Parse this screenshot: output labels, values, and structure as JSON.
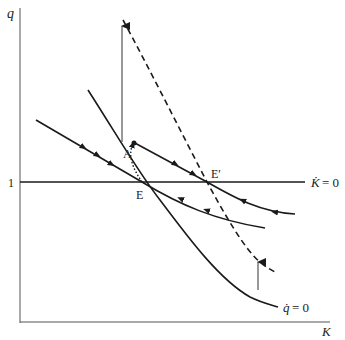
{
  "diagram": {
    "type": "phase-diagram",
    "axes": {
      "x_label": "K",
      "y_label": "q",
      "y_tick_label": "1"
    },
    "loci": {
      "k_dot_zero": {
        "label_lhs": "K̇",
        "label_rhs": "= 0"
      },
      "q_dot_zero": {
        "label_lhs": "q̇",
        "label_rhs": "= 0"
      },
      "q_dot_zero_shifted": {
        "style": "dashed"
      }
    },
    "points": {
      "E": "E",
      "E_prime": "E′",
      "A": "A"
    },
    "colors": {
      "line": "#1a1a1a",
      "axis": "#555555",
      "background": "#ffffff"
    }
  }
}
